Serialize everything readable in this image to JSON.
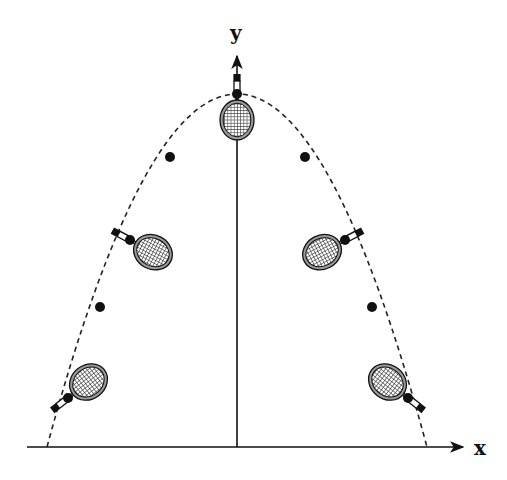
{
  "diagram": {
    "axes": {
      "x_label": "x",
      "y_label": "y",
      "origin": [
        237,
        447
      ],
      "x_axis": {
        "x1": 27,
        "x2": 465,
        "y": 447
      },
      "y_axis": {
        "x": 237,
        "y1": 447,
        "y2": 55
      }
    },
    "trajectory": {
      "type": "parabola",
      "style": "dashed",
      "apex": [
        237,
        94
      ],
      "left_base": [
        47,
        447
      ],
      "right_base": [
        427,
        447
      ]
    },
    "center_of_mass_points": [
      [
        237,
        94
      ],
      [
        170,
        157
      ],
      [
        305,
        157
      ],
      [
        130,
        240
      ],
      [
        345,
        240
      ],
      [
        100,
        307
      ],
      [
        372,
        307
      ],
      [
        68,
        398
      ],
      [
        408,
        398
      ]
    ],
    "rackets": [
      {
        "name": "racket-apex",
        "cx": 237,
        "cy": 94,
        "angle": 0
      },
      {
        "name": "racket-upper-left",
        "cx": 130,
        "cy": 240,
        "angle": -62
      },
      {
        "name": "racket-upper-right",
        "cx": 345,
        "cy": 240,
        "angle": 62
      },
      {
        "name": "racket-lower-left",
        "cx": 68,
        "cy": 398,
        "angle": 52
      },
      {
        "name": "racket-lower-right",
        "cx": 408,
        "cy": 398,
        "angle": -52
      }
    ],
    "colors": {
      "line": "#111111",
      "background": "#ffffff",
      "head_fill": "#9a9a9a"
    }
  }
}
